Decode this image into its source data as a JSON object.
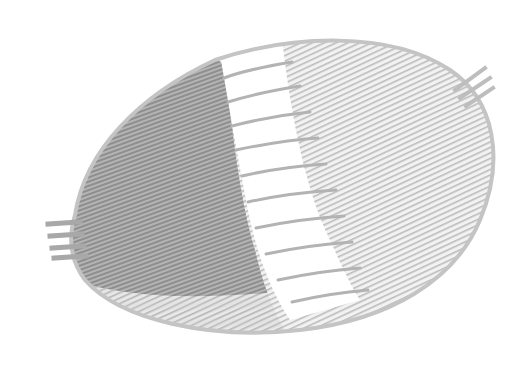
{
  "image": {
    "subject": "woven wicker basket tray, partially woven",
    "background_color": "#ffffff",
    "colors": {
      "dense_weave": "#9a9a9a",
      "light_weave": "#c8c8c8",
      "spokes": "#b0b0b0",
      "rim": "#bdbdbd"
    }
  }
}
